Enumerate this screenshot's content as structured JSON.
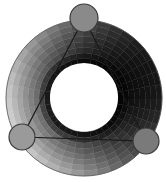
{
  "widget": {
    "type": "color-harmony-wheel",
    "mode": "triad",
    "center": [
      84,
      98
    ],
    "outer_radius": 78,
    "inner_radius": 34,
    "rings": 8,
    "segments": 36,
    "background": "#ffffff",
    "hole_color": "#ffffff",
    "outline_color": "#3a3a3a"
  },
  "handles": [
    {
      "name": "handle-top",
      "cx": 84,
      "cy": 18,
      "r": 14,
      "fill": "#8a8a8a"
    },
    {
      "name": "handle-left",
      "cx": 22,
      "cy": 137,
      "r": 13,
      "fill": "#9a9a9a"
    },
    {
      "name": "handle-right",
      "cx": 146,
      "cy": 141,
      "r": 13,
      "fill": "#7a7a7a"
    }
  ]
}
